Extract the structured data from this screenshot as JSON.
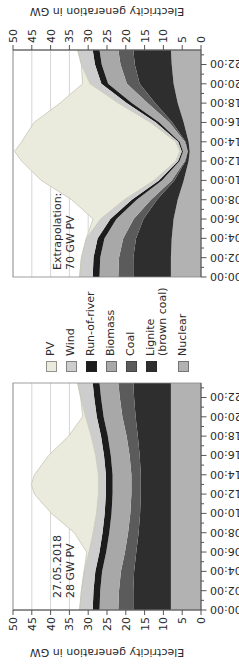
{
  "figure": {
    "ylabel": "Electricity generation in GW",
    "background": "#ffffff",
    "grid_color": "#cccccc",
    "spine_color": "#888888",
    "axis_color": "#555555",
    "text_color": "#2b2b2b",
    "value_ticks": [
      "0",
      "5",
      "10",
      "15",
      "20",
      "25",
      "30",
      "35",
      "40",
      "45",
      "50"
    ],
    "time_ticks": [
      "00:00",
      "02:00",
      "04:00",
      "06:00",
      "08:00",
      "10:00",
      "12:00",
      "14:00",
      "16:00",
      "18:00",
      "20:00",
      "22:00"
    ]
  },
  "legend": {
    "items": [
      {
        "label": "PV",
        "color": "#ebebdd"
      },
      {
        "label": "Wind",
        "color": "#cdcdcd"
      },
      {
        "label": "Run-of-river",
        "color": "#1c1c1c"
      },
      {
        "label": "Biomass",
        "color": "#a8a8a8"
      },
      {
        "label": "Coal",
        "color": "#5b5b5b"
      },
      {
        "label": "Lignite\n(brown coal)",
        "color": "#2e2e2e"
      },
      {
        "label": "Nuclear",
        "color": "#b2b2b2"
      }
    ]
  },
  "chart_data": [
    {
      "type": "area",
      "position": "left",
      "annotation_line1": "27.05.2018",
      "annotation_line2": "28 GW PV",
      "xlabel": "time of day",
      "ylabel": "Electricity generation in GW",
      "ylim": [
        0,
        50
      ],
      "x_hours": [
        0,
        2,
        4,
        6,
        8,
        10,
        12,
        13,
        14,
        16,
        18,
        20,
        22,
        23.5
      ],
      "series": [
        {
          "name": "Nuclear",
          "color": "#b2b2b2",
          "values": [
            8,
            8,
            8,
            8,
            8,
            8,
            8,
            8,
            8,
            8,
            8,
            8,
            8,
            8
          ]
        },
        {
          "name": "Lignite (brown coal)",
          "color": "#2e2e2e",
          "values": [
            10,
            10,
            9.8,
            9.2,
            8.6,
            8.2,
            8,
            8,
            8,
            8.3,
            8.8,
            9.4,
            9.8,
            10
          ]
        },
        {
          "name": "Coal",
          "color": "#5b5b5b",
          "values": [
            4,
            3.8,
            3.5,
            3,
            2.8,
            2.6,
            2.5,
            2.5,
            2.5,
            2.7,
            3,
            3.5,
            3.8,
            4
          ]
        },
        {
          "name": "Biomass",
          "color": "#a8a8a8",
          "values": [
            5,
            5,
            5,
            5,
            5,
            5,
            5,
            5,
            5,
            5,
            5,
            5,
            5,
            5
          ]
        },
        {
          "name": "Run-of-river",
          "color": "#1c1c1c",
          "values": [
            1.8,
            1.8,
            1.8,
            1.8,
            1.8,
            1.8,
            1.8,
            1.8,
            1.8,
            1.8,
            1.8,
            1.8,
            1.8,
            1.8
          ]
        },
        {
          "name": "Wind",
          "color": "#cdcdcd",
          "values": [
            3.5,
            3.2,
            3,
            2.8,
            2.5,
            2.2,
            2,
            2,
            2,
            2.2,
            2.6,
            3,
            3.6,
            4
          ]
        },
        {
          "name": "PV",
          "color": "#ebebdd",
          "stroke": "#c6c6b6",
          "values": [
            0,
            0,
            0,
            0.6,
            5,
            12,
            17,
            17.8,
            17,
            12.5,
            6,
            0.8,
            0,
            0
          ]
        }
      ]
    },
    {
      "type": "area",
      "position": "right",
      "annotation_line1": "Extrapolation:",
      "annotation_line2": "70 GW PV",
      "xlabel": "time of day",
      "ylabel": "Electricity generation in GW",
      "ylim": [
        0,
        50
      ],
      "x_hours": [
        0,
        2,
        4,
        6,
        8,
        10,
        12,
        13,
        14,
        16,
        18,
        20,
        22,
        23.5
      ],
      "series": [
        {
          "name": "Nuclear",
          "color": "#b2b2b2",
          "values": [
            8,
            8,
            7.8,
            7.3,
            6.2,
            4.6,
            3.3,
            3,
            3.3,
            4.6,
            6.2,
            7.3,
            7.8,
            8
          ]
        },
        {
          "name": "Lignite (brown coal)",
          "color": "#2e2e2e",
          "values": [
            10,
            10,
            9.5,
            8,
            5.5,
            2.5,
            0.8,
            0.5,
            0.8,
            3,
            6,
            9,
            9.8,
            10
          ]
        },
        {
          "name": "Coal",
          "color": "#5b5b5b",
          "values": [
            4,
            3.8,
            3.4,
            2.6,
            1.6,
            0.7,
            0.2,
            0.1,
            0.2,
            0.8,
            2,
            3.4,
            3.8,
            4
          ]
        },
        {
          "name": "Biomass",
          "color": "#a8a8a8",
          "values": [
            5,
            5,
            5,
            4.6,
            3.8,
            2.6,
            1.4,
            1.2,
            1.4,
            2.7,
            4.2,
            5,
            5,
            5
          ]
        },
        {
          "name": "Run-of-river",
          "color": "#1c1c1c",
          "values": [
            1.8,
            1.8,
            1.8,
            1.6,
            1.3,
            0.8,
            0.4,
            0.3,
            0.4,
            0.9,
            1.4,
            1.8,
            1.8,
            1.8
          ]
        },
        {
          "name": "Wind",
          "color": "#cdcdcd",
          "values": [
            3.5,
            3.2,
            3,
            2.6,
            2,
            1.3,
            0.6,
            0.5,
            0.6,
            1.4,
            2.2,
            3,
            3.6,
            4
          ]
        },
        {
          "name": "PV",
          "color": "#ebebdd",
          "stroke": "#c6c6b6",
          "values": [
            0,
            0,
            0,
            2,
            14,
            30,
            41,
            44,
            41,
            31,
            15.5,
            2,
            0,
            0
          ]
        }
      ]
    }
  ]
}
